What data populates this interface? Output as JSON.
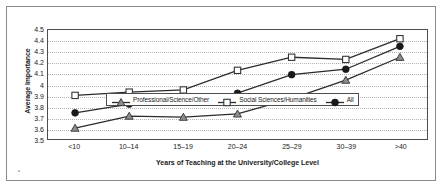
{
  "chart_data": {
    "type": "line",
    "title": "",
    "xlabel": "Years of Teaching at the University/College Level",
    "ylabel": "Average Importance",
    "categories": [
      "<10",
      "10–14",
      "15–19",
      "20–24",
      "25–29",
      "30–39",
      ">40"
    ],
    "ylim": [
      3.5,
      4.5
    ],
    "ytick_labels": [
      "4.5",
      "4.4",
      "4.3",
      "4.2",
      "4.1",
      "4",
      "3.9",
      "3.8",
      "3.7",
      "3.6",
      "3.5"
    ],
    "ytick_values": [
      4.5,
      4.4,
      4.3,
      4.2,
      4.1,
      4.0,
      3.9,
      3.8,
      3.7,
      3.6,
      3.5
    ],
    "grid": true,
    "legend_position": "inside-bottom-center",
    "series": [
      {
        "name": "Professional/Science/Other",
        "marker": "triangle",
        "color": "#808080",
        "values": [
          3.6,
          3.71,
          3.7,
          3.73,
          3.87,
          4.04,
          4.25
        ]
      },
      {
        "name": "Social Sciences/Humanities",
        "marker": "open-square",
        "color": "#ffffff",
        "values": [
          3.9,
          3.93,
          3.95,
          4.13,
          4.25,
          4.23,
          4.42
        ]
      },
      {
        "name": "All",
        "marker": "filled-circle",
        "color": "#1a1a1a",
        "values": [
          3.74,
          3.82,
          3.84,
          3.92,
          4.09,
          4.14,
          4.35
        ]
      }
    ]
  },
  "legend": {
    "items": [
      {
        "label": "Professional/Science/Other"
      },
      {
        "label": "Social Sciences/Humanities"
      },
      {
        "label": "All"
      }
    ]
  }
}
